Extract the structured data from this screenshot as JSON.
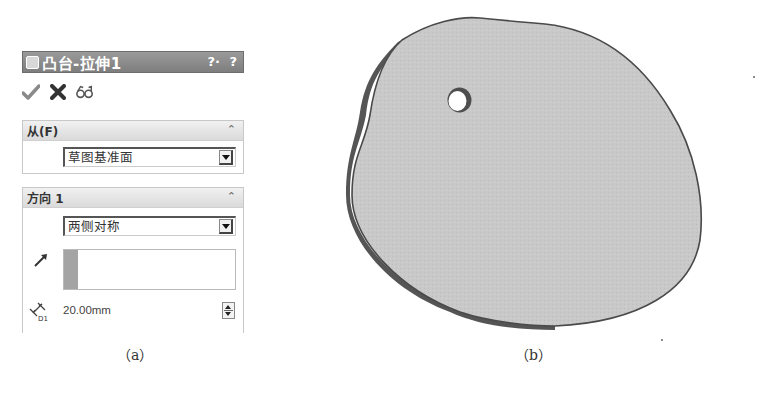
{
  "property_manager": {
    "title": "凸台-拉伸1",
    "help_icons": [
      "?·",
      "?"
    ],
    "actions": {
      "ok_icon": "checkmark-icon",
      "cancel_icon": "x-icon",
      "preview_icon": "detailed-preview-icon"
    },
    "from_group": {
      "title": "从(F)",
      "selected": "草图基准面"
    },
    "direction1_group": {
      "title": "方向 1",
      "end_condition": "两侧对称",
      "direction_reference": "",
      "depth_value": "20.00mm",
      "depth_icon_label": "D1"
    }
  },
  "captions": {
    "left": "（a）",
    "right": "（b）"
  },
  "model_view": {
    "description": "Extruded irregular rounded plate with a single through-hole",
    "face_color": "#c9c9c9",
    "edge_color": "#5a5a5a"
  }
}
